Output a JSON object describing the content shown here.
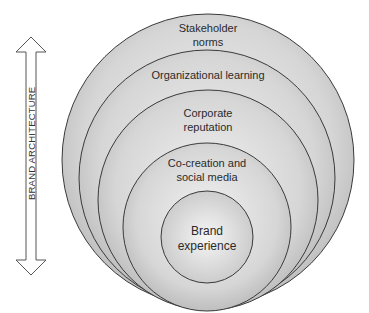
{
  "axis": {
    "label": "BRAND ARCHITECTURE",
    "type": "double-headed vertical arrow"
  },
  "layers": [
    {
      "name": "stakeholder-norms",
      "lines": [
        "Stakeholder",
        "norms"
      ],
      "level": 1
    },
    {
      "name": "organizational-learning",
      "lines": [
        "Organizational learning"
      ],
      "level": 2
    },
    {
      "name": "corporate-reputation",
      "lines": [
        "Corporate",
        "reputation"
      ],
      "level": 3
    },
    {
      "name": "co-creation-social-media",
      "lines": [
        "Co-creation and",
        "social media"
      ],
      "level": 4
    },
    {
      "name": "brand-experience",
      "lines": [
        "Brand",
        "experience"
      ],
      "level": 5
    }
  ],
  "colors": {
    "stroke": "#3a3a3a",
    "fill_light": "#f4f4f4",
    "fill_dark": "#b8b8b8",
    "text": "#2a2a2a"
  }
}
